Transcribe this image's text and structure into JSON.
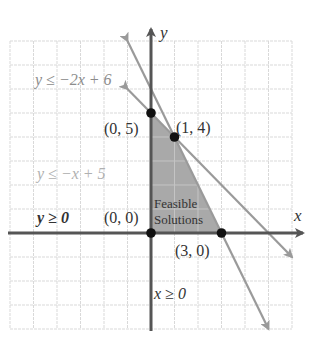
{
  "colors": {
    "background": "#ffffff",
    "grid": "#d9d9d9",
    "axis": "#555555",
    "boundary_line": "#9a9a9a",
    "feasible_region": "#a9a9a9",
    "vertex_dot": "#111111",
    "label_dark": "#333333",
    "label_gray": "#8c8c8c",
    "label_light": "#b0b0b0"
  },
  "axes": {
    "x_label": "x",
    "y_label": "y"
  },
  "labels": {
    "ineq_1": "y ≤ −2x + 6",
    "ineq_2": "y ≤ −x + 5",
    "ineq_3": "y ≥ 0",
    "ineq_4": "x ≥ 0",
    "region_line1": "Feasible",
    "region_line2": "Solutions",
    "pt_00": "(0, 0)",
    "pt_05": "(0, 5)",
    "pt_14": "(1, 4)",
    "pt_30": "(3, 0)"
  },
  "chart_data": {
    "type": "line",
    "title": "",
    "xlabel": "x",
    "ylabel": "y",
    "xlim": [
      -6,
      6
    ],
    "ylim": [
      -4,
      8
    ],
    "grid": true,
    "series": [
      {
        "name": "y ≤ −2x + 6",
        "kind": "boundary_line",
        "equation": "y = -2x + 6",
        "x": [
          -1,
          5
        ],
        "y": [
          8,
          -4
        ]
      },
      {
        "name": "y ≤ −x + 5",
        "kind": "boundary_line",
        "equation": "y = -x + 5",
        "x": [
          -1,
          6
        ],
        "y": [
          6,
          -1
        ]
      },
      {
        "name": "y ≥ 0",
        "kind": "boundary_line",
        "equation": "y = 0"
      },
      {
        "name": "x ≥ 0",
        "kind": "boundary_line",
        "equation": "x = 0"
      }
    ],
    "feasible_region": {
      "label": "Feasible Solutions",
      "vertices": [
        [
          0,
          0
        ],
        [
          0,
          5
        ],
        [
          1,
          4
        ],
        [
          3,
          0
        ]
      ]
    },
    "points": [
      {
        "label": "(0, 0)",
        "x": 0,
        "y": 0
      },
      {
        "label": "(0, 5)",
        "x": 0,
        "y": 5
      },
      {
        "label": "(1, 4)",
        "x": 1,
        "y": 4
      },
      {
        "label": "(3, 0)",
        "x": 3,
        "y": 0
      }
    ],
    "annotations": [
      "y ≤ −2x + 6",
      "y ≤ −x + 5",
      "y ≥ 0",
      "x ≥ 0",
      "Feasible Solutions"
    ]
  }
}
